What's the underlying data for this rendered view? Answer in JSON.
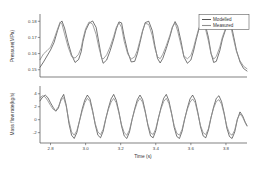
{
  "figure": {
    "background_color": "#ffffff",
    "modelled_color": "#2b2b2b",
    "measured_color": "#8f8f8f"
  },
  "legend": {
    "position": "top-right",
    "modelled_label": "Modelled",
    "measured_label": "Measured"
  },
  "xaxis": {
    "label": "Time (s)",
    "ticks": [
      "2.8",
      "3.0",
      "3.2",
      "3.4",
      "3.6",
      "3.8"
    ]
  },
  "top_panel": {
    "ylabel": "Pressure(MPa)",
    "yticks": [
      "0.18",
      "0.17",
      "0.16",
      "0.15"
    ]
  },
  "bottom_panel": {
    "ylabel": "Mass flow rate(kg/s)",
    "yticks": [
      "4",
      "2",
      "0",
      "-2"
    ]
  },
  "chart_data": [
    {
      "type": "line",
      "title": "",
      "xlabel": "Time (s)",
      "ylabel": "Pressure(MPa)",
      "xlim": [
        2.74,
        3.92
      ],
      "ylim": [
        0.1455,
        0.1845
      ],
      "xticks": [
        2.8,
        3.0,
        3.2,
        3.4,
        3.6,
        3.8
      ],
      "yticks": [
        0.15,
        0.16,
        0.17,
        0.18
      ],
      "grid": false,
      "legend": [
        "Modelled",
        "Measured"
      ],
      "series": [
        {
          "name": "Modelled",
          "x": [
            2.74,
            2.76,
            2.78,
            2.8,
            2.82,
            2.84,
            2.855,
            2.865,
            2.88,
            2.9,
            2.92,
            2.94,
            2.96,
            2.975,
            2.985,
            3.0,
            3.02,
            3.04,
            3.06,
            3.075,
            3.09,
            3.1,
            3.12,
            3.14,
            3.16,
            3.175,
            3.19,
            3.205,
            3.22,
            3.24,
            3.26,
            3.28,
            3.295,
            3.31,
            3.325,
            3.34,
            3.36,
            3.38,
            3.395,
            3.41,
            3.425,
            3.44,
            3.46,
            3.48,
            3.495,
            3.51,
            3.525,
            3.545,
            3.56,
            3.58,
            3.6,
            3.615,
            3.63,
            3.645,
            3.66,
            3.68,
            3.7,
            3.715,
            3.73,
            3.745,
            3.765,
            3.78,
            3.8,
            3.815,
            3.83,
            3.845,
            3.86,
            3.88,
            3.9,
            3.92
          ],
          "y": [
            0.1515,
            0.1548,
            0.1585,
            0.1622,
            0.1668,
            0.1742,
            0.179,
            0.1802,
            0.1758,
            0.1668,
            0.1592,
            0.1545,
            0.1563,
            0.1612,
            0.1675,
            0.1742,
            0.1788,
            0.1802,
            0.1762,
            0.1672,
            0.1578,
            0.154,
            0.156,
            0.1618,
            0.169,
            0.1752,
            0.1796,
            0.179,
            0.1705,
            0.161,
            0.1548,
            0.1552,
            0.16,
            0.1668,
            0.1738,
            0.1792,
            0.18,
            0.1742,
            0.1648,
            0.157,
            0.1542,
            0.157,
            0.1632,
            0.1702,
            0.1762,
            0.1798,
            0.1768,
            0.167,
            0.158,
            0.154,
            0.156,
            0.1615,
            0.1685,
            0.1748,
            0.1792,
            0.1788,
            0.17,
            0.1602,
            0.1545,
            0.1552,
            0.1618,
            0.169,
            0.1755,
            0.1798,
            0.178,
            0.17,
            0.162,
            0.1548,
            0.1508,
            0.1492
          ]
        },
        {
          "name": "Measured",
          "x": [
            2.74,
            2.76,
            2.78,
            2.8,
            2.82,
            2.84,
            2.855,
            2.865,
            2.88,
            2.9,
            2.92,
            2.94,
            2.96,
            2.975,
            2.985,
            3.0,
            3.02,
            3.04,
            3.06,
            3.075,
            3.09,
            3.1,
            3.12,
            3.14,
            3.16,
            3.175,
            3.19,
            3.205,
            3.22,
            3.24,
            3.26,
            3.28,
            3.295,
            3.31,
            3.325,
            3.34,
            3.36,
            3.38,
            3.395,
            3.41,
            3.425,
            3.44,
            3.46,
            3.48,
            3.495,
            3.51,
            3.525,
            3.545,
            3.56,
            3.58,
            3.6,
            3.615,
            3.63,
            3.645,
            3.66,
            3.68,
            3.7,
            3.715,
            3.73,
            3.745,
            3.765,
            3.78,
            3.8,
            3.815,
            3.83,
            3.845,
            3.86,
            3.88,
            3.9,
            3.92
          ],
          "y": [
            0.1562,
            0.1598,
            0.1618,
            0.164,
            0.169,
            0.1752,
            0.1796,
            0.1784,
            0.1722,
            0.1642,
            0.1582,
            0.1572,
            0.1596,
            0.1636,
            0.1692,
            0.1754,
            0.1796,
            0.1782,
            0.1718,
            0.164,
            0.1578,
            0.1566,
            0.1592,
            0.1642,
            0.1706,
            0.1762,
            0.1792,
            0.1762,
            0.1676,
            0.1598,
            0.1566,
            0.158,
            0.162,
            0.1682,
            0.1744,
            0.1788,
            0.178,
            0.1712,
            0.1632,
            0.158,
            0.1568,
            0.1596,
            0.165,
            0.1712,
            0.1766,
            0.179,
            0.1738,
            0.1648,
            0.1586,
            0.1568,
            0.1588,
            0.1636,
            0.1698,
            0.1756,
            0.1788,
            0.1768,
            0.1678,
            0.1598,
            0.1566,
            0.1582,
            0.164,
            0.1704,
            0.1762,
            0.179,
            0.1756,
            0.1682,
            0.1612,
            0.1556,
            0.1522,
            0.1506
          ]
        }
      ]
    },
    {
      "type": "line",
      "title": "",
      "xlabel": "Time (s)",
      "ylabel": "Mass flow rate(kg/s)",
      "xlim": [
        2.74,
        3.92
      ],
      "ylim": [
        -3.6,
        5.2
      ],
      "xticks": [
        2.8,
        3.0,
        3.2,
        3.4,
        3.6,
        3.8
      ],
      "yticks": [
        -2,
        0,
        2,
        4
      ],
      "grid": false,
      "legend": [
        "Modelled",
        "Measured"
      ],
      "series": [
        {
          "name": "Modelled",
          "x": [
            2.74,
            2.755,
            2.77,
            2.785,
            2.8,
            2.815,
            2.83,
            2.845,
            2.86,
            2.875,
            2.89,
            2.905,
            2.92,
            2.935,
            2.95,
            2.965,
            2.98,
            2.995,
            3.01,
            3.025,
            3.04,
            3.055,
            3.07,
            3.085,
            3.1,
            3.115,
            3.13,
            3.145,
            3.16,
            3.175,
            3.19,
            3.205,
            3.22,
            3.235,
            3.25,
            3.265,
            3.28,
            3.295,
            3.31,
            3.325,
            3.34,
            3.355,
            3.37,
            3.385,
            3.4,
            3.415,
            3.43,
            3.445,
            3.46,
            3.475,
            3.49,
            3.505,
            3.52,
            3.535,
            3.55,
            3.565,
            3.58,
            3.595,
            3.61,
            3.625,
            3.64,
            3.655,
            3.67,
            3.685,
            3.7,
            3.715,
            3.73,
            3.745,
            3.76,
            3.775,
            3.79,
            3.805,
            3.82,
            3.835,
            3.85,
            3.865,
            3.88,
            3.895,
            3.91,
            3.92
          ],
          "y": [
            2.9,
            3.5,
            3.8,
            3.4,
            2.6,
            1.9,
            1.3,
            1.8,
            3.2,
            3.9,
            2.2,
            -0.6,
            -2.4,
            -2.9,
            -2.0,
            -0.2,
            1.6,
            3.0,
            3.8,
            3.2,
            1.4,
            -0.8,
            -2.4,
            -2.8,
            -1.8,
            0.1,
            1.8,
            3.2,
            3.9,
            3.0,
            1.2,
            -1.0,
            -2.5,
            -2.9,
            -1.9,
            0.0,
            1.7,
            3.1,
            3.8,
            3.1,
            1.3,
            -0.9,
            -2.5,
            -2.8,
            -1.7,
            0.2,
            1.9,
            3.3,
            3.9,
            2.9,
            1.0,
            -1.2,
            -2.6,
            -2.9,
            -1.8,
            0.1,
            1.8,
            3.2,
            3.8,
            3.0,
            1.1,
            -1.1,
            -2.5,
            -2.8,
            -1.6,
            0.3,
            2.0,
            3.3,
            3.7,
            2.8,
            1.0,
            -1.3,
            -2.6,
            -2.9,
            -1.9,
            0.0,
            1.2,
            0.6,
            -0.4,
            -0.9
          ]
        },
        {
          "name": "Measured",
          "x": [
            2.74,
            2.755,
            2.77,
            2.785,
            2.8,
            2.815,
            2.83,
            2.845,
            2.86,
            2.875,
            2.89,
            2.905,
            2.92,
            2.935,
            2.95,
            2.965,
            2.98,
            2.995,
            3.01,
            3.025,
            3.04,
            3.055,
            3.07,
            3.085,
            3.1,
            3.115,
            3.13,
            3.145,
            3.16,
            3.175,
            3.19,
            3.205,
            3.22,
            3.235,
            3.25,
            3.265,
            3.28,
            3.295,
            3.31,
            3.325,
            3.34,
            3.355,
            3.37,
            3.385,
            3.4,
            3.415,
            3.43,
            3.445,
            3.46,
            3.475,
            3.49,
            3.505,
            3.52,
            3.535,
            3.55,
            3.565,
            3.58,
            3.595,
            3.61,
            3.625,
            3.64,
            3.655,
            3.67,
            3.685,
            3.7,
            3.715,
            3.73,
            3.745,
            3.76,
            3.775,
            3.79,
            3.805,
            3.82,
            3.835,
            3.85,
            3.865,
            3.88,
            3.895,
            3.91,
            3.92
          ],
          "y": [
            3.4,
            3.7,
            3.5,
            2.9,
            2.2,
            1.6,
            1.4,
            2.0,
            3.0,
            3.4,
            2.0,
            -0.2,
            -1.9,
            -2.4,
            -1.7,
            -0.2,
            1.3,
            2.6,
            3.3,
            2.8,
            1.2,
            -0.6,
            -1.9,
            -2.3,
            -1.5,
            0.2,
            1.6,
            2.7,
            3.3,
            2.6,
            1.0,
            -0.8,
            -2.0,
            -2.4,
            -1.6,
            0.1,
            1.5,
            2.7,
            3.3,
            2.7,
            1.1,
            -0.7,
            -2.0,
            -2.3,
            -1.4,
            0.3,
            1.7,
            2.8,
            3.3,
            2.5,
            0.9,
            -0.9,
            -2.1,
            -2.4,
            -1.5,
            0.2,
            1.6,
            2.7,
            3.2,
            2.6,
            0.9,
            -0.9,
            -2.0,
            -2.3,
            -1.4,
            0.4,
            1.8,
            2.8,
            3.1,
            2.4,
            0.8,
            -1.0,
            -2.1,
            -2.4,
            -1.6,
            0.1,
            0.9,
            0.4,
            -0.5,
            -1.0
          ]
        }
      ]
    }
  ]
}
